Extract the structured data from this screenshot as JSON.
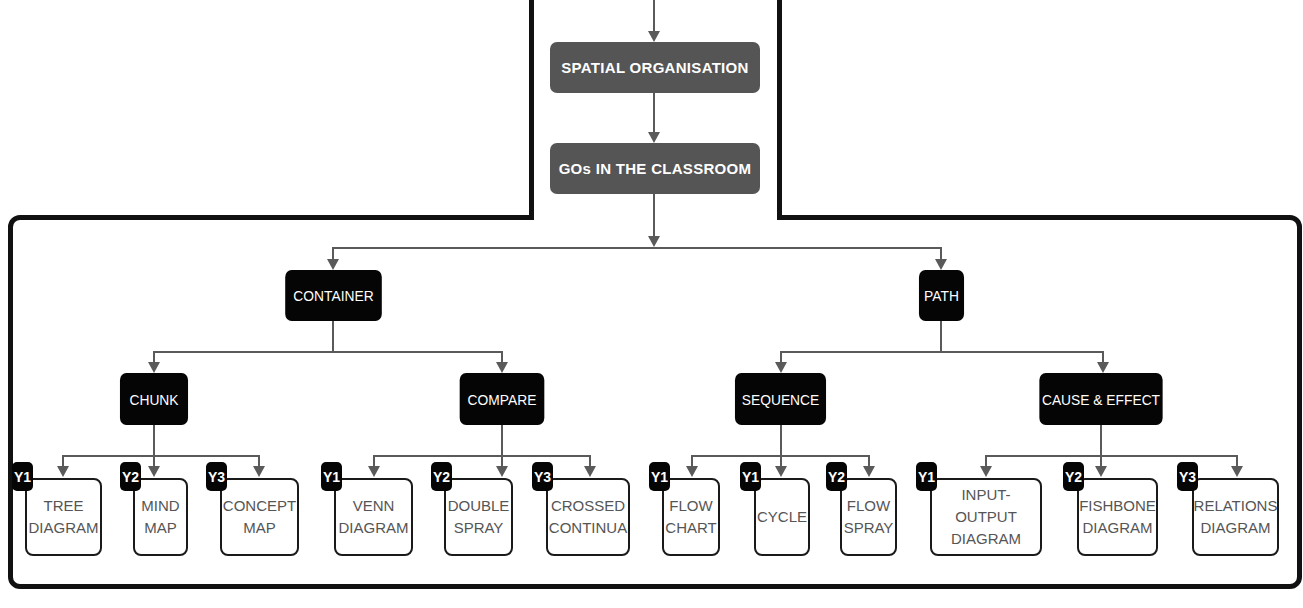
{
  "top": {
    "spatial": "SPATIAL ORGANISATION",
    "classroom": "GOs IN THE CLASSROOM"
  },
  "level1": {
    "container": "CONTAINER",
    "path": "PATH"
  },
  "level2": {
    "chunk": "CHUNK",
    "compare": "COMPARE",
    "sequence": "SEQUENCE",
    "cause_effect": "CAUSE & EFFECT"
  },
  "leaves": [
    {
      "year": "Y1",
      "label": "TREE\nDIAGRAM"
    },
    {
      "year": "Y2",
      "label": "MIND\nMAP"
    },
    {
      "year": "Y3",
      "label": "CONCEPT\nMAP"
    },
    {
      "year": "Y1",
      "label": "VENN\nDIAGRAM"
    },
    {
      "year": "Y2",
      "label": "DOUBLE\nSPRAY"
    },
    {
      "year": "Y3",
      "label": "CROSSED\nCONTINUA"
    },
    {
      "year": "Y1",
      "label": "FLOW\nCHART"
    },
    {
      "year": "Y1",
      "label": "CYCLE"
    },
    {
      "year": "Y2",
      "label": "FLOW\nSPRAY"
    },
    {
      "year": "Y1",
      "label": "INPUT-OUTPUT\nDIAGRAM"
    },
    {
      "year": "Y2",
      "label": "FISHBONE\nDIAGRAM"
    },
    {
      "year": "Y3",
      "label": "RELATIONS\nDIAGRAM"
    }
  ],
  "colors": {
    "grey_node": "#555555",
    "black_node": "#050505",
    "connector": "#5a5a5a",
    "leaf_text": "#555555"
  }
}
